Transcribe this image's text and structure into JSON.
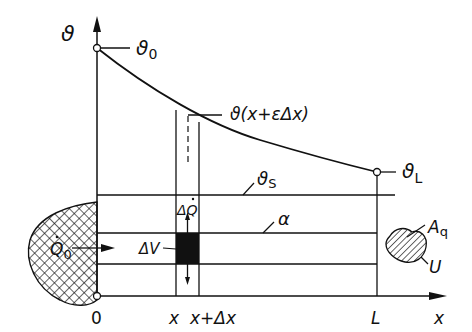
{
  "figure": {
    "type": "fin temperature distribution diagram",
    "axes": {
      "y_label": "ϑ",
      "x_label": "x",
      "origin_label": "0",
      "x_ticks": [
        {
          "label": "0"
        },
        {
          "label": "x"
        },
        {
          "label": "x+Δx"
        },
        {
          "label": "L"
        }
      ]
    },
    "curve_labels": {
      "theta_0": "ϑ",
      "theta_0_sub": "0",
      "theta_L": "ϑ",
      "theta_L_sub": "L",
      "theta_mid": "ϑ(x+εΔx)",
      "theta_S": "ϑ",
      "theta_S_sub": "S"
    },
    "rod_labels": {
      "heat_in": "Q",
      "heat_in_sub": "0",
      "heat_loss": "ΔQ",
      "volume_element": "ΔV",
      "heat_transfer_coeff": "α",
      "cross_section_area": "A",
      "cross_section_area_sub": "q",
      "perimeter": "U"
    },
    "colors": {
      "line": "#111111",
      "background": "#ffffff"
    }
  }
}
